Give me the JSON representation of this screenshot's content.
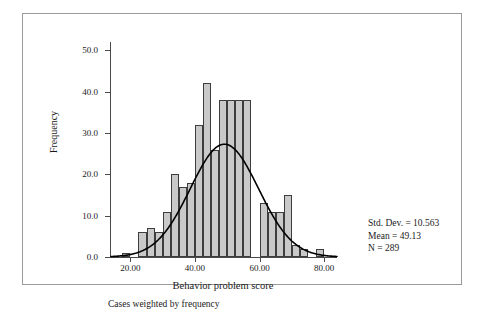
{
  "chart_data": {
    "type": "bar",
    "title": "",
    "subtitle": "",
    "xlabel": "Behavior problem score",
    "ylabel": "Frequency",
    "xlim": [
      14,
      84
    ],
    "ylim": [
      0,
      52
    ],
    "grid": false,
    "legend": "none",
    "bin_width": 2.5,
    "x_ticks": [
      "20.00",
      "40.00",
      "60.00",
      "80.00"
    ],
    "x_tick_values": [
      20,
      40,
      60,
      80
    ],
    "y_ticks": [
      "0.0",
      "10.0",
      "20.0",
      "30.0",
      "40.0",
      "50.0"
    ],
    "y_tick_values": [
      0,
      10,
      20,
      30,
      40,
      50
    ],
    "bin_centers": [
      18.75,
      21.25,
      23.75,
      26.25,
      28.75,
      31.25,
      33.75,
      36.25,
      38.75,
      41.25,
      43.75,
      46.25,
      48.75,
      51.25,
      53.75,
      56.25,
      58.75,
      61.25,
      63.75,
      66.25,
      68.75,
      71.25,
      73.75,
      76.25,
      78.75
    ],
    "values": [
      1,
      0,
      6,
      7,
      6,
      11,
      20,
      17,
      18,
      32,
      42,
      26,
      38,
      38,
      38,
      38,
      0,
      13,
      11,
      11,
      15,
      3,
      2,
      0,
      2
    ],
    "overlay": {
      "type": "normal-curve",
      "mean": 49.13,
      "std_dev": 10.563,
      "n": 289,
      "color": "#000000"
    },
    "annotations": {
      "std_dev_label": "Std. Dev. = 10.563",
      "mean_label": "Mean = 49.13",
      "n_label": "N = 289",
      "footnote": "Cases weighted by frequency"
    },
    "colors": {
      "bar_fill": "#c9c9c9",
      "bar_edge": "#3d3d3d",
      "curve": "#000000",
      "axis": "#4a4a4a",
      "frame": "#9a9a9a"
    }
  }
}
